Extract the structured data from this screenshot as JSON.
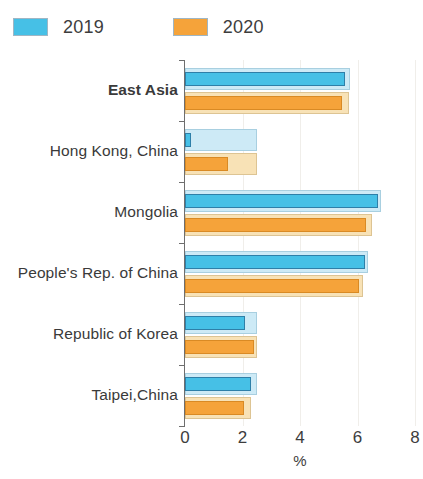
{
  "legend": {
    "position": "top-left",
    "entries": [
      {
        "label": "2019",
        "color": "#46c0e6",
        "light_color": "#cdeaf6"
      },
      {
        "label": "2020",
        "color": "#f5a33a",
        "light_color": "#f8e2b6"
      }
    ]
  },
  "axis": {
    "x_tick_labels": [
      "0",
      "2",
      "4",
      "6",
      "8"
    ],
    "x_title": "%"
  },
  "chart_data": {
    "type": "bar",
    "orientation": "horizontal",
    "title": "",
    "subtitle": "",
    "xlabel": "%",
    "ylabel": "",
    "xlim": [
      0,
      8
    ],
    "xticks": [
      0,
      2,
      4,
      6,
      8
    ],
    "grid": true,
    "legend_position": "top-left",
    "categories": [
      "East Asia",
      "Hong Kong, China",
      "Mongolia",
      "People's Rep. of China",
      "Republic of Korea",
      "Taipei,China"
    ],
    "bold_categories": [
      "East Asia"
    ],
    "series": [
      {
        "name": "2019",
        "color": "#46c0e6",
        "light_color": "#cdeaf6",
        "values": [
          5.55,
          0.2,
          6.7,
          6.25,
          2.1,
          2.3
        ],
        "outer_values": [
          5.75,
          2.5,
          6.8,
          6.35,
          2.5,
          2.5
        ]
      },
      {
        "name": "2020",
        "color": "#f5a33a",
        "light_color": "#f8e2b6",
        "values": [
          5.45,
          1.5,
          6.3,
          6.05,
          2.4,
          2.05
        ],
        "outer_values": [
          5.7,
          2.5,
          6.5,
          6.2,
          2.5,
          2.3
        ]
      }
    ]
  }
}
